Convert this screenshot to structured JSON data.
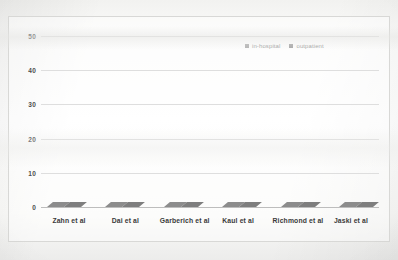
{
  "chart_data": {
    "type": "bar",
    "title": "",
    "xlabel": "",
    "ylabel": "",
    "ylim": [
      0,
      50
    ],
    "yticks": [
      50,
      40,
      30,
      20,
      10,
      0
    ],
    "grid": true,
    "legend_position": "top-right",
    "categories": [
      "Zahn et al",
      "Dai et al",
      "Garberich et al",
      "Kaul et al",
      "Richmond et al",
      "Jaski et al"
    ],
    "series": [
      {
        "name": "in-hospital",
        "color": "#7a7a7a",
        "values": [
          27,
          40,
          8,
          33,
          14,
          41
        ]
      },
      {
        "name": "outpatient",
        "color": "#666666",
        "values": [
          15,
          5,
          6,
          11,
          7,
          10
        ]
      }
    ]
  },
  "legend": {
    "items": [
      {
        "label": "in-hospital",
        "marker": "square-marker"
      },
      {
        "label": "outpatient",
        "marker": "square-marker"
      }
    ]
  },
  "axis": {
    "y_ticks": [
      "50",
      "40",
      "30",
      "20",
      "10",
      "0"
    ]
  }
}
